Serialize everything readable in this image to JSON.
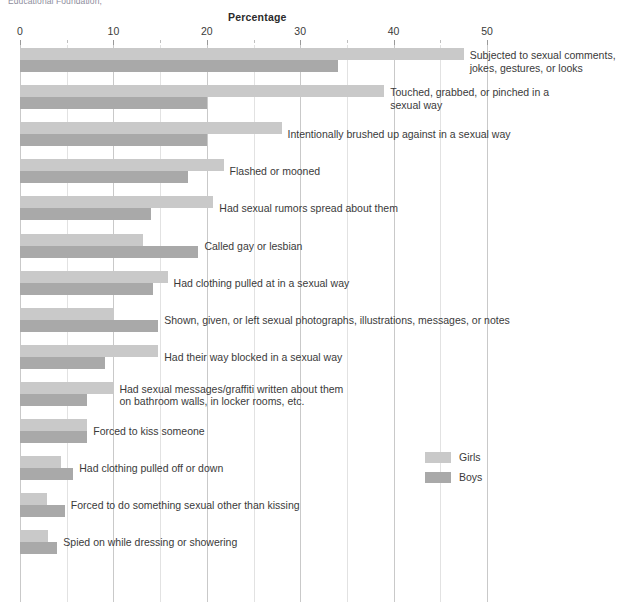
{
  "credit": {
    "text": "Educational Foundation,"
  },
  "legend": {
    "position": "right-middle",
    "items": [
      {
        "label": "Girls",
        "color": "#c9c9c9"
      },
      {
        "label": "Boys",
        "color": "#a9a9a9"
      }
    ]
  },
  "chart_data": {
    "type": "bar",
    "orientation": "horizontal",
    "title": "Percentage",
    "xlabel": "Percentage",
    "ylabel": "",
    "xlim": [
      0,
      52
    ],
    "xticks": [
      0,
      10,
      20,
      30,
      40,
      50
    ],
    "xtick_labels": [
      "0",
      "10",
      "20",
      "30",
      "40",
      "50"
    ],
    "minor_tick_step": 5,
    "grid": "vertical",
    "categories": [
      "Subjected to sexual comments,\njokes, gestures, or looks",
      "Touched, grabbed, or pinched in a\nsexual way",
      "Intentionally brushed up against in a sexual way",
      "Flashed or mooned",
      "Had sexual rumors spread about them",
      "Called gay or lesbian",
      "Had clothing pulled at in a sexual way",
      "Shown, given, or left sexual photographs, illustrations, messages, or notes",
      "Had their way blocked in a sexual way",
      "Had sexual messages/graffiti written about them\non bathroom walls, in locker rooms, etc.",
      "Forced to kiss someone",
      "Had clothing pulled off or down",
      "Forced to do something sexual other than kissing",
      "Spied on while dressing or showering"
    ],
    "series": [
      {
        "name": "Girls",
        "color": "#c9c9c9",
        "values": [
          47.5,
          39.0,
          28.0,
          21.8,
          20.7,
          13.2,
          15.8,
          10.0,
          14.8,
          10.0,
          7.2,
          4.4,
          2.9,
          3.0
        ]
      },
      {
        "name": "Boys",
        "color": "#a9a9a9",
        "values": [
          34.0,
          20.0,
          20.0,
          18.0,
          14.0,
          19.1,
          14.2,
          14.8,
          9.1,
          7.2,
          7.2,
          5.7,
          4.8,
          4.0
        ]
      }
    ]
  }
}
